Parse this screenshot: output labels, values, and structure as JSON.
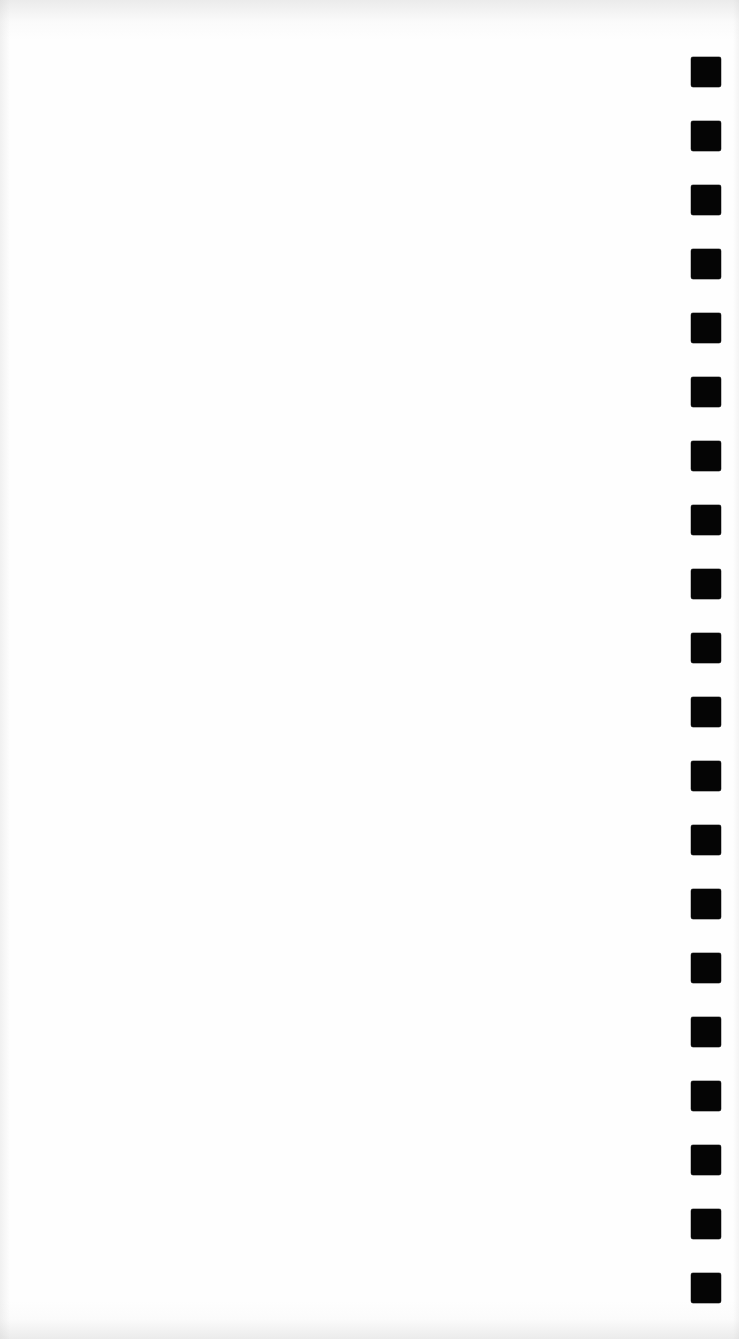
{
  "document": {
    "type": "scanned blank sheet",
    "body_text": "",
    "background_color": "#fefefe"
  },
  "timing_marks": {
    "count": 20,
    "color": "#050505",
    "size_px": 30,
    "x_px": 691,
    "first_y_px": 57,
    "pitch_px": 64,
    "positions_y_px": [
      57,
      121,
      185,
      249,
      313,
      377,
      441,
      505,
      569,
      633,
      697,
      761,
      825,
      889,
      953,
      1017,
      1081,
      1145,
      1209,
      1273
    ]
  }
}
